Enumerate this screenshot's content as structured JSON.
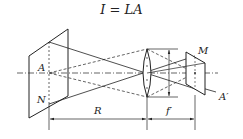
{
  "title": "I = LA",
  "labels": {
    "A": "A",
    "N": "N",
    "M": "M",
    "A_prime": "A′",
    "R": "R",
    "f_prime": "f′"
  },
  "colors": {
    "line": "#222222",
    "background": "#ffffff"
  }
}
